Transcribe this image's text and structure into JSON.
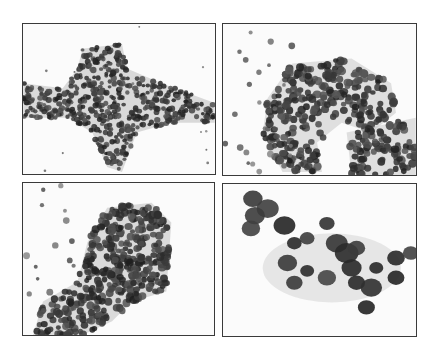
{
  "figure": {
    "layout": "2x2 grid of cytology micrographs",
    "background": "#ffffff",
    "border_color": "#3a3a3a",
    "panels": [
      {
        "position": "top-left",
        "description": "branching sheet of small, densely packed epithelial cells",
        "stain_color": "#2e2e2e"
      },
      {
        "position": "top-right",
        "description": "loose clusters of small round cells with scattered single cells",
        "stain_color": "#4a4a4a"
      },
      {
        "position": "bottom-left",
        "description": "large cohesive cluster of crowded cells",
        "stain_color": "#3c3c3c"
      },
      {
        "position": "bottom-right",
        "description": "high magnification cluster of large dark nuclei",
        "stain_color": "#2a2a2a"
      }
    ]
  }
}
